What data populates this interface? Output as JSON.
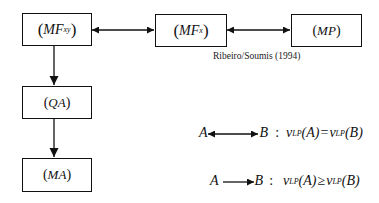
{
  "nodes": {
    "mfxy": {
      "open": "(",
      "main": "MF",
      "sub": "xy",
      "close": ")"
    },
    "mfx": {
      "open": "(",
      "main": "MF",
      "sub": "x",
      "close": ")"
    },
    "mp": {
      "open": "(",
      "main": "MP",
      "sub": "",
      "close": ")"
    },
    "qa": {
      "open": "(",
      "main": "QA",
      "sub": "",
      "close": ")"
    },
    "ma": {
      "open": "(",
      "main": "MA",
      "sub": "",
      "close": ")"
    }
  },
  "edges": [
    {
      "from": "mfxy",
      "to": "mfx",
      "type": "bidirectional"
    },
    {
      "from": "mfx",
      "to": "mp",
      "type": "bidirectional"
    },
    {
      "from": "mfxy",
      "to": "qa",
      "type": "directed"
    },
    {
      "from": "qa",
      "to": "ma",
      "type": "directed"
    }
  ],
  "citation": "Ribeiro/Soumis (1994)",
  "legend": [
    {
      "left": "A",
      "right": "B",
      "colon": ":",
      "lhs_v": "v",
      "lhs_sub": "LP",
      "lhs_arg": "(A)",
      "op": "=",
      "rhs_v": "v",
      "rhs_sub": "LP",
      "rhs_arg": "(B)",
      "arrow": "bidirectional"
    },
    {
      "left": "A",
      "right": "B",
      "colon": ":",
      "lhs_v": "v",
      "lhs_sub": "LP",
      "lhs_arg": "(A)",
      "op": "≥",
      "rhs_v": "v",
      "rhs_sub": "LP",
      "rhs_arg": "(B)",
      "arrow": "directed"
    }
  ]
}
